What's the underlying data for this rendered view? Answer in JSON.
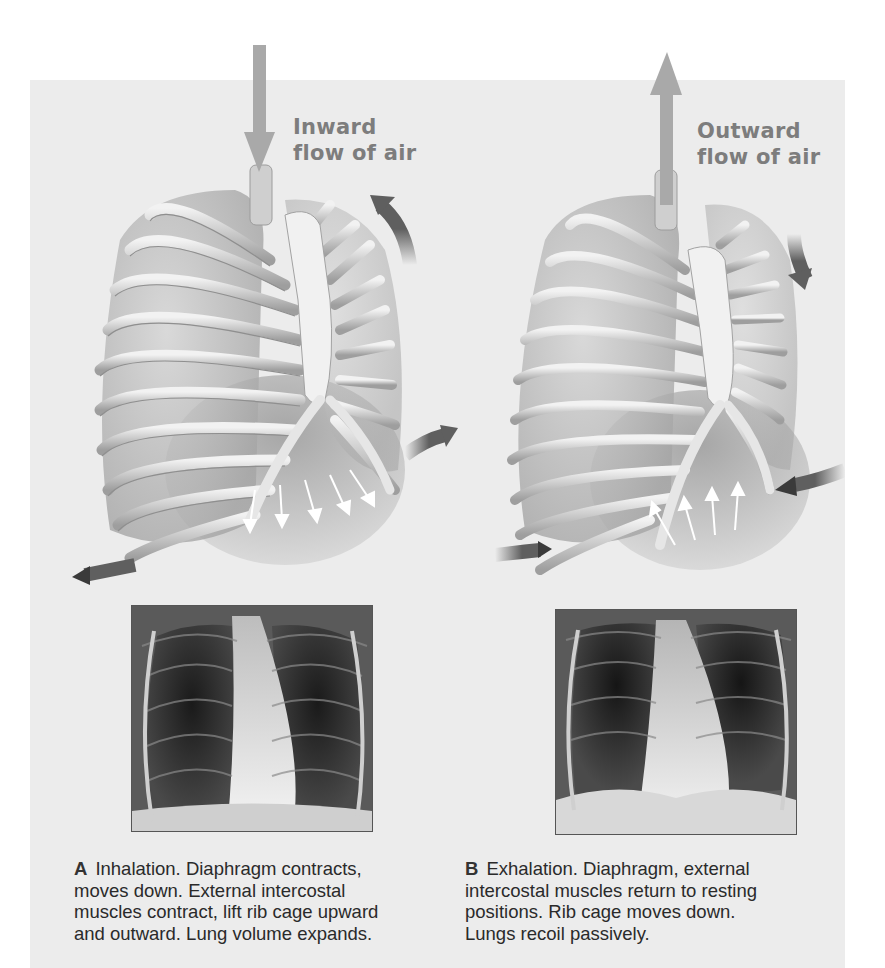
{
  "figure": {
    "background_color": "#ececec",
    "arrow_color_air": "#a9a9a9",
    "arrow_color_motion": "#5f5f5f",
    "panel_a": {
      "flow_label_line1": "Inward",
      "flow_label_line2": "flow of air",
      "air_arrow_direction": "down",
      "rib_arrow_direction": "up-outward",
      "diaphragm_arrows": "down",
      "xray_caption": "chest x-ray, inhalation"
    },
    "panel_b": {
      "flow_label_line1": "Outward",
      "flow_label_line2": "flow of air",
      "air_arrow_direction": "up",
      "rib_arrow_direction": "down-inward",
      "diaphragm_arrows": "up",
      "xray_caption": "chest x-ray, exhalation"
    }
  },
  "captions": {
    "a": {
      "letter": "A",
      "lines": [
        "Inhalation. Diaphragm contracts,",
        "moves down. External intercostal",
        "muscles contract, lift rib cage upward",
        "and outward. Lung volume expands."
      ]
    },
    "b": {
      "letter": "B",
      "lines": [
        "Exhalation. Diaphragm, external",
        "intercostal muscles return to resting",
        "positions. Rib cage moves down.",
        "Lungs recoil passively."
      ]
    }
  }
}
